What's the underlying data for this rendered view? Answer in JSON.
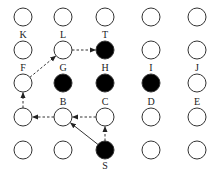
{
  "diagram": {
    "title": "",
    "grid": {
      "columns": [
        23,
        63,
        105,
        151,
        197
      ],
      "rows": [
        17,
        50,
        83,
        117,
        150
      ],
      "radius": 9
    },
    "colors": {
      "stroke": "#333333",
      "filled": "#000000",
      "empty": "#ffffff",
      "label": "#222222"
    },
    "nodes": [
      {
        "id": "r0c0",
        "label": "",
        "row": 0,
        "col": 0,
        "filled": false
      },
      {
        "id": "r0c1",
        "label": "",
        "row": 0,
        "col": 1,
        "filled": false
      },
      {
        "id": "r0c2",
        "label": "",
        "row": 0,
        "col": 2,
        "filled": false
      },
      {
        "id": "r0c3",
        "label": "",
        "row": 0,
        "col": 3,
        "filled": false
      },
      {
        "id": "r0c4",
        "label": "",
        "row": 0,
        "col": 4,
        "filled": false
      },
      {
        "id": "K",
        "label": "K",
        "row": 1,
        "col": 0,
        "filled": false,
        "label_pos": "above"
      },
      {
        "id": "L",
        "label": "L",
        "row": 1,
        "col": 1,
        "filled": false,
        "label_pos": "above"
      },
      {
        "id": "T",
        "label": "T",
        "row": 1,
        "col": 2,
        "filled": true,
        "label_pos": "above"
      },
      {
        "id": "r1c3",
        "label": "",
        "row": 1,
        "col": 3,
        "filled": false
      },
      {
        "id": "r1c4",
        "label": "",
        "row": 1,
        "col": 4,
        "filled": false
      },
      {
        "id": "F",
        "label": "F",
        "row": 2,
        "col": 0,
        "filled": false,
        "label_pos": "above"
      },
      {
        "id": "G",
        "label": "G",
        "row": 2,
        "col": 1,
        "filled": true,
        "label_pos": "above"
      },
      {
        "id": "H",
        "label": "H",
        "row": 2,
        "col": 2,
        "filled": true,
        "label_pos": "above"
      },
      {
        "id": "I",
        "label": "I",
        "row": 2,
        "col": 3,
        "filled": true,
        "label_pos": "above"
      },
      {
        "id": "J",
        "label": "J",
        "row": 2,
        "col": 4,
        "filled": false,
        "label_pos": "above"
      },
      {
        "id": "r3c0",
        "label": "",
        "row": 3,
        "col": 0,
        "filled": false
      },
      {
        "id": "B",
        "label": "B",
        "row": 3,
        "col": 1,
        "filled": false,
        "label_pos": "above"
      },
      {
        "id": "C",
        "label": "C",
        "row": 3,
        "col": 2,
        "filled": false,
        "label_pos": "above"
      },
      {
        "id": "D",
        "label": "D",
        "row": 3,
        "col": 3,
        "filled": false,
        "label_pos": "above"
      },
      {
        "id": "E",
        "label": "E",
        "row": 3,
        "col": 4,
        "filled": false,
        "label_pos": "above"
      },
      {
        "id": "r4c0",
        "label": "",
        "row": 4,
        "col": 0,
        "filled": false
      },
      {
        "id": "r4c1",
        "label": "",
        "row": 4,
        "col": 1,
        "filled": false
      },
      {
        "id": "S",
        "label": "S",
        "row": 4,
        "col": 2,
        "filled": true,
        "label_pos": "below"
      },
      {
        "id": "r4c3",
        "label": "",
        "row": 4,
        "col": 3,
        "filled": false
      },
      {
        "id": "r4c4",
        "label": "",
        "row": 4,
        "col": 4,
        "filled": false
      }
    ],
    "edges": [
      {
        "from": "S",
        "to": "B",
        "style": "solid"
      },
      {
        "from": "S",
        "to": "C",
        "style": "dashed"
      },
      {
        "from": "C",
        "to": "B",
        "style": "dashed"
      },
      {
        "from": "B",
        "to": "r3c0",
        "style": "dashed"
      },
      {
        "from": "r3c0",
        "to": "F",
        "style": "dashed"
      },
      {
        "from": "F",
        "to": "L",
        "style": "dashed"
      },
      {
        "from": "L",
        "to": "T",
        "style": "dashed"
      }
    ]
  }
}
